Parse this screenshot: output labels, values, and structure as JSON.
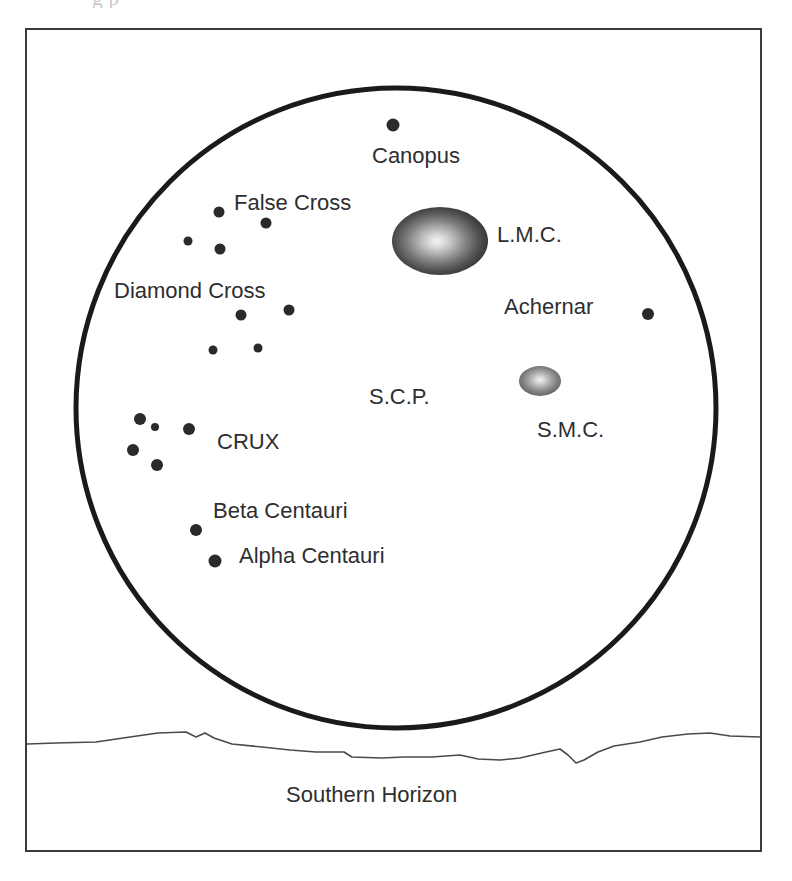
{
  "figure": {
    "clipped_caption_above": "g                                               p",
    "horizon_label": "Southern Horizon",
    "frame": {
      "x": 25,
      "y": 28,
      "width": 737,
      "height": 824
    },
    "sky_circle": {
      "cx": 396,
      "cy": 408,
      "r": 320,
      "stroke": "#1a1a1a",
      "stroke_width": 5
    },
    "colors": {
      "ink": "#2e2e30",
      "frame": "#3a3a3c",
      "star": "#2a2a2c",
      "circle": "#1a1a1a",
      "horizon": "#4a4a4c",
      "background": "#ffffff"
    }
  },
  "labels": [
    {
      "name": "canopus",
      "text": "Canopus",
      "x": 372,
      "y": 145,
      "size": 22
    },
    {
      "name": "false-cross",
      "text": "False Cross",
      "x": 234,
      "y": 192,
      "size": 22
    },
    {
      "name": "lmc",
      "text": "L.M.C.",
      "x": 497,
      "y": 224,
      "size": 22
    },
    {
      "name": "diamond-cross",
      "text": "Diamond Cross",
      "x": 114,
      "y": 280,
      "size": 22
    },
    {
      "name": "achernar",
      "text": "Achernar",
      "x": 504,
      "y": 296,
      "size": 22
    },
    {
      "name": "scp",
      "text": "S.C.P.",
      "x": 369,
      "y": 386,
      "size": 22
    },
    {
      "name": "smc",
      "text": "S.M.C.",
      "x": 537,
      "y": 419,
      "size": 22
    },
    {
      "name": "crux",
      "text": "CRUX",
      "x": 217,
      "y": 431,
      "size": 22
    },
    {
      "name": "beta-centauri",
      "text": "Beta Centauri",
      "x": 213,
      "y": 500,
      "size": 22
    },
    {
      "name": "alpha-centauri",
      "text": "Alpha Centauri",
      "x": 239,
      "y": 545,
      "size": 22
    }
  ],
  "stars": [
    {
      "name": "canopus-star",
      "x": 393,
      "y": 125,
      "r": 6.5
    },
    {
      "name": "false-cross-star-1",
      "x": 219,
      "y": 212,
      "r": 5.5
    },
    {
      "name": "false-cross-star-2",
      "x": 266,
      "y": 223,
      "r": 5.5
    },
    {
      "name": "false-cross-star-3",
      "x": 188,
      "y": 241,
      "r": 4.5
    },
    {
      "name": "false-cross-star-4",
      "x": 220,
      "y": 249,
      "r": 5.5
    },
    {
      "name": "diamond-cross-star-1",
      "x": 241,
      "y": 315,
      "r": 5.5
    },
    {
      "name": "diamond-cross-star-2",
      "x": 289,
      "y": 310,
      "r": 5.5
    },
    {
      "name": "diamond-cross-star-3",
      "x": 213,
      "y": 350,
      "r": 4.5
    },
    {
      "name": "diamond-cross-star-4",
      "x": 258,
      "y": 348,
      "r": 4.5
    },
    {
      "name": "achernar-star",
      "x": 648,
      "y": 314,
      "r": 6.0
    },
    {
      "name": "crux-star-gacrux",
      "x": 140,
      "y": 419,
      "r": 6.0
    },
    {
      "name": "crux-star-small",
      "x": 155,
      "y": 427,
      "r": 4.0
    },
    {
      "name": "crux-star-acrux",
      "x": 189,
      "y": 429,
      "r": 6.0
    },
    {
      "name": "crux-star-delta",
      "x": 133,
      "y": 450,
      "r": 6.0
    },
    {
      "name": "crux-star-beta",
      "x": 157,
      "y": 465,
      "r": 6.0
    },
    {
      "name": "beta-centauri-star",
      "x": 196,
      "y": 530,
      "r": 6.0
    },
    {
      "name": "alpha-centauri-star",
      "x": 215,
      "y": 561,
      "r": 6.5
    }
  ],
  "nebulae": [
    {
      "name": "large-magellanic-cloud",
      "label": "L.M.C.",
      "cx": 440,
      "cy": 241,
      "rx": 48,
      "ry": 34
    },
    {
      "name": "small-magellanic-cloud",
      "label": "S.M.C.",
      "cx": 540,
      "cy": 381,
      "rx": 21,
      "ry": 15
    }
  ]
}
